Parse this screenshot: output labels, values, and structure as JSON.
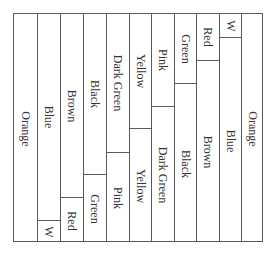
{
  "diagram": {
    "grid": {
      "left": 13,
      "top": 13,
      "width": 250,
      "height": 229
    },
    "line_color": "#5a5a5a",
    "columns": [
      {
        "cells": [
          {
            "label": "Orange",
            "start": 0,
            "end": 229
          }
        ]
      },
      {
        "cells": [
          {
            "label": "Blue",
            "start": 0,
            "end": 206
          },
          {
            "label": "W",
            "start": 206,
            "end": 229
          }
        ]
      },
      {
        "cells": [
          {
            "label": "Brown",
            "start": 0,
            "end": 183
          },
          {
            "label": "Red",
            "start": 183,
            "end": 229
          }
        ]
      },
      {
        "cells": [
          {
            "label": "Black",
            "start": 0,
            "end": 160
          },
          {
            "label": "Green",
            "start": 160,
            "end": 229
          }
        ]
      },
      {
        "cells": [
          {
            "label": "Dark Green",
            "start": 0,
            "end": 138
          },
          {
            "label": "Pink",
            "start": 138,
            "end": 229
          }
        ]
      },
      {
        "cells": [
          {
            "label": "Yellow",
            "start": 0,
            "end": 114
          },
          {
            "label": "Yellow",
            "start": 114,
            "end": 229
          }
        ]
      },
      {
        "cells": [
          {
            "label": "Pink",
            "start": 0,
            "end": 92
          },
          {
            "label": "Dark Green",
            "start": 92,
            "end": 229
          }
        ]
      },
      {
        "cells": [
          {
            "label": "Green",
            "start": 0,
            "end": 69
          },
          {
            "label": "Black",
            "start": 69,
            "end": 229
          }
        ]
      },
      {
        "cells": [
          {
            "label": "Red",
            "start": 0,
            "end": 46
          },
          {
            "label": "Brown",
            "start": 46,
            "end": 229
          }
        ]
      },
      {
        "cells": [
          {
            "label": "W",
            "start": 0,
            "end": 23
          },
          {
            "label": "Blue",
            "start": 23,
            "end": 229
          }
        ]
      },
      {
        "cells": [
          {
            "label": "Orange",
            "start": 0,
            "end": 229
          }
        ]
      }
    ]
  }
}
